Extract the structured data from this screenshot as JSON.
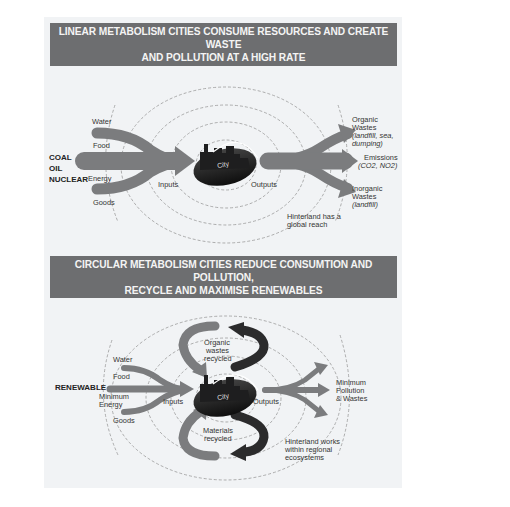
{
  "top": {
    "title_line1": "LINEAR METABOLISM CITIES CONSUME RESOURCES AND CREATE WASTE",
    "title_line2": "AND POLLUTION AT A HIGH RATE",
    "sources": [
      "COAL",
      "OIL",
      "NUCLEAR"
    ],
    "inputs": {
      "water": "Water",
      "food": "Food",
      "energy": "Energy",
      "goods": "Goods"
    },
    "inputs_label": "Inputs",
    "outputs_label": "Outputs",
    "city_label": "City",
    "outputs": {
      "organic_1": "Organic",
      "organic_2": "Wastes",
      "organic_3": "(landfill, sea,",
      "organic_4": "dumping)",
      "emissions_1": "Emissions",
      "emissions_2": "(CO2, NO2)",
      "inorganic_1": "Inorganic",
      "inorganic_2": "Wastes",
      "inorganic_3": "(landfill)"
    },
    "hinterland_1": "Hinterland has a",
    "hinterland_2": "global reach"
  },
  "bottom": {
    "title_line1": "CIRCULAR METABOLISM CITIES REDUCE CONSUMTION AND POLLUTION,",
    "title_line2": "RECYCLE AND MAXIMISE RENEWABLES",
    "source": "RENEWABLE",
    "inputs": {
      "water": "Water",
      "food": "Food",
      "energy_1": "Minimum",
      "energy_2": "Energy",
      "goods": "Goods"
    },
    "inputs_label": "Inputs",
    "outputs_label": "Outputs",
    "city_label": "City",
    "organic_1": "Organic",
    "organic_2": "wastes",
    "organic_3": "recycled",
    "materials_1": "Materials",
    "materials_2": "recycled",
    "output_1": "Minimum",
    "output_2": "Pollution",
    "output_3": "& Wastes",
    "hinterland_1": "Hinterland works",
    "hinterland_2": "within regional",
    "hinterland_3": "ecosystems"
  },
  "colors": {
    "banner": "#6d6e70",
    "panel": "#f1f3f5",
    "arrow": "#7b7c7e",
    "dark_arrow": "#2b2b2c",
    "city": "#1e1e1f"
  }
}
